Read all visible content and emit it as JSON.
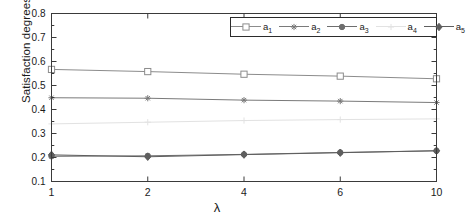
{
  "chart_data": {
    "type": "line",
    "title": "",
    "xlabel": "λ",
    "ylabel": "Satisfaction degrees",
    "x": [
      1,
      2,
      4,
      6,
      10
    ],
    "xtick_labels": [
      "1",
      "2",
      "4",
      "6",
      "10"
    ],
    "ytick_labels": [
      "0.1",
      "0.2",
      "0.3",
      "0.4",
      "0.5",
      "0.6",
      "0.7",
      "0.8"
    ],
    "ylim": [
      0.1,
      0.8
    ],
    "ystep": 0.1,
    "grid": false,
    "legend_position": "top-right",
    "series": [
      {
        "name": "a1",
        "label": "a",
        "sub": "1",
        "marker": "square",
        "color": "#8c8c8c",
        "values": [
          0.567,
          0.558,
          0.547,
          0.539,
          0.528
        ]
      },
      {
        "name": "a2",
        "label": "a",
        "sub": "2",
        "marker": "star",
        "color": "#7a7a7a",
        "values": [
          0.449,
          0.447,
          0.439,
          0.435,
          0.429
        ]
      },
      {
        "name": "a3",
        "label": "a",
        "sub": "3",
        "marker": "circle",
        "color": "#6e6e6e",
        "values": [
          0.205,
          0.207,
          0.213,
          0.221,
          0.228
        ]
      },
      {
        "name": "a4",
        "label": "a",
        "sub": "4",
        "marker": "plus",
        "color": "#e2e2e2",
        "values": [
          0.34,
          0.347,
          0.354,
          0.358,
          0.361
        ]
      },
      {
        "name": "a5",
        "label": "a",
        "sub": "5",
        "marker": "diamond",
        "color": "#5e5e5e",
        "values": [
          0.211,
          0.203,
          0.212,
          0.22,
          0.228
        ]
      }
    ]
  },
  "axes": {
    "frame_color": "#3a3a3a",
    "background": "#ffffff"
  }
}
